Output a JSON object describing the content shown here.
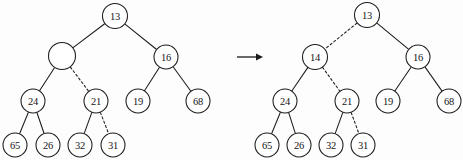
{
  "figure": {
    "background_color": "#fdfdfd",
    "stroke_color": "#1b1b1b",
    "node_fill_color": "#ffffff",
    "width": 463,
    "height": 160
  },
  "chart_data": {
    "type": "diagram",
    "subtype": "binary-tree-pair",
    "trees": [
      {
        "id": "before",
        "name": "left-tree",
        "root": "n13",
        "nodes": [
          {
            "id": "n13",
            "label": "13",
            "cx": 115,
            "cy": 16,
            "r": 12.5,
            "empty": false
          },
          {
            "id": "nEmpty",
            "label": "",
            "cx": 62,
            "cy": 56,
            "r": 13.5,
            "empty": true
          },
          {
            "id": "n16",
            "label": "16",
            "cx": 166,
            "cy": 57,
            "r": 12.0,
            "empty": false
          },
          {
            "id": "n24",
            "label": "24",
            "cx": 33,
            "cy": 101,
            "r": 12.0,
            "empty": false
          },
          {
            "id": "n21",
            "label": "21",
            "cx": 96,
            "cy": 101,
            "r": 12.0,
            "empty": false
          },
          {
            "id": "n19",
            "label": "19",
            "cx": 138,
            "cy": 101,
            "r": 12.0,
            "empty": false
          },
          {
            "id": "n68",
            "label": "68",
            "cx": 198,
            "cy": 101,
            "r": 12.0,
            "empty": false
          },
          {
            "id": "n65",
            "label": "65",
            "cx": 15,
            "cy": 145,
            "r": 12.0,
            "empty": false
          },
          {
            "id": "n26",
            "label": "26",
            "cx": 48,
            "cy": 145,
            "r": 12.0,
            "empty": false
          },
          {
            "id": "n32",
            "label": "32",
            "cx": 80,
            "cy": 145,
            "r": 12.0,
            "empty": false
          },
          {
            "id": "n31",
            "label": "31",
            "cx": 113,
            "cy": 145,
            "r": 12.0,
            "empty": false
          }
        ],
        "edges": [
          {
            "from": "n13",
            "to": "nEmpty",
            "style": "solid"
          },
          {
            "from": "n13",
            "to": "n16",
            "style": "solid"
          },
          {
            "from": "nEmpty",
            "to": "n24",
            "style": "solid"
          },
          {
            "from": "nEmpty",
            "to": "n21",
            "style": "dashed"
          },
          {
            "from": "n16",
            "to": "n19",
            "style": "solid"
          },
          {
            "from": "n16",
            "to": "n68",
            "style": "solid"
          },
          {
            "from": "n24",
            "to": "n65",
            "style": "solid"
          },
          {
            "from": "n24",
            "to": "n26",
            "style": "solid"
          },
          {
            "from": "n21",
            "to": "n32",
            "style": "solid"
          },
          {
            "from": "n21",
            "to": "n31",
            "style": "dashed"
          }
        ]
      },
      {
        "id": "after",
        "name": "right-tree",
        "root": "m13",
        "nodes": [
          {
            "id": "m13",
            "label": "13",
            "cx": 367,
            "cy": 15,
            "r": 12.5,
            "empty": false
          },
          {
            "id": "m14",
            "label": "14",
            "cx": 315,
            "cy": 57,
            "r": 12.5,
            "empty": false
          },
          {
            "id": "m16",
            "label": "16",
            "cx": 418,
            "cy": 57,
            "r": 12.0,
            "empty": false
          },
          {
            "id": "m24",
            "label": "24",
            "cx": 285,
            "cy": 101,
            "r": 12.0,
            "empty": false
          },
          {
            "id": "m21",
            "label": "21",
            "cx": 347,
            "cy": 101,
            "r": 12.0,
            "empty": false
          },
          {
            "id": "m19",
            "label": "19",
            "cx": 388,
            "cy": 101,
            "r": 12.0,
            "empty": false
          },
          {
            "id": "m68",
            "label": "68",
            "cx": 449,
            "cy": 101,
            "r": 12.0,
            "empty": false
          },
          {
            "id": "m65",
            "label": "65",
            "cx": 267,
            "cy": 145,
            "r": 12.0,
            "empty": false
          },
          {
            "id": "m26",
            "label": "26",
            "cx": 299,
            "cy": 145,
            "r": 12.0,
            "empty": false
          },
          {
            "id": "m32",
            "label": "32",
            "cx": 331,
            "cy": 145,
            "r": 12.0,
            "empty": false
          },
          {
            "id": "m31",
            "label": "31",
            "cx": 363,
            "cy": 145,
            "r": 12.0,
            "empty": false
          }
        ],
        "edges": [
          {
            "from": "m13",
            "to": "m14",
            "style": "dashed"
          },
          {
            "from": "m13",
            "to": "m16",
            "style": "solid"
          },
          {
            "from": "m14",
            "to": "m24",
            "style": "solid"
          },
          {
            "from": "m14",
            "to": "m21",
            "style": "dashed"
          },
          {
            "from": "m16",
            "to": "m19",
            "style": "solid"
          },
          {
            "from": "m16",
            "to": "m68",
            "style": "solid"
          },
          {
            "from": "m24",
            "to": "m65",
            "style": "solid"
          },
          {
            "from": "m24",
            "to": "m26",
            "style": "solid"
          },
          {
            "from": "m21",
            "to": "m32",
            "style": "solid"
          },
          {
            "from": "m21",
            "to": "m31",
            "style": "dashed"
          }
        ]
      }
    ],
    "arrow": {
      "name": "transformation-arrow",
      "label": "",
      "x1": 237,
      "y1": 57,
      "x2": 263,
      "y2": 57
    }
  }
}
